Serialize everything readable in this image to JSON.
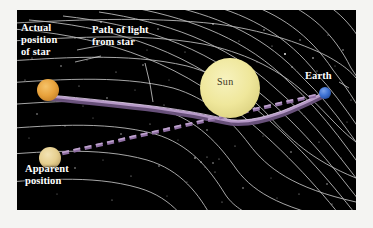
{
  "figure": {
    "background_color": "#f4f4f2",
    "panel_color": "#000000"
  },
  "labels": {
    "actual_position": "Actual\nposition\nof star",
    "actual_position_lines": [
      "Actual",
      "position",
      "of star"
    ],
    "path_of_light": "Path of light\nfrom star",
    "path_of_light_lines": [
      "Path of light",
      "from star"
    ],
    "apparent_position": "Apparent\nposition",
    "apparent_position_lines": [
      "Apparent",
      "position"
    ],
    "earth": "Earth",
    "sun": "Sun"
  },
  "objects": {
    "sun": {
      "name": "Sun",
      "color": "#efe79b",
      "edge_color": "#d8cf7e",
      "cx": 213,
      "cy": 78,
      "r": 30
    },
    "actual_star": {
      "name": "Actual position of star",
      "color": "#e8a23c",
      "edge_color": "#c4832c",
      "cx": 31,
      "cy": 80,
      "r": 11
    },
    "apparent_star": {
      "name": "Apparent position of star",
      "color": "#e6cf8f",
      "edge_color": "#c7ae73",
      "cx": 33,
      "cy": 148,
      "r": 11
    },
    "earth": {
      "name": "Earth",
      "color": "#3e72d4",
      "edge_color": "#2a55a8",
      "cx": 308,
      "cy": 83,
      "r": 6
    }
  },
  "paths": {
    "actual_light_path": {
      "name": "Curved path of light from star",
      "style": "solid",
      "color": "#9c7fae",
      "highlight_color": "#c9aed8",
      "width": 3.2
    },
    "apparent_line_of_sight": {
      "name": "Apparent straight line of sight",
      "style": "dashed",
      "color": "#9a7aac",
      "width": 2.6
    }
  },
  "spacetime_grid": {
    "name": "Curved spacetime grid",
    "color": "#c9c9c9",
    "line_width": 0.9,
    "rows": 8,
    "cols": 11,
    "warped_near": "Sun"
  },
  "starfield": {
    "name": "Background stars",
    "color": "#ffffff",
    "count": 70
  },
  "colors": {
    "sun": "#efe79b",
    "earth": "#3e72d4",
    "actual_star": "#e8a23c",
    "apparent_star": "#e6cf8f",
    "grid": "#c9c9c9",
    "light_path": "#9c7fae",
    "label_text": "#ffffff",
    "panel_background": "#000000"
  }
}
